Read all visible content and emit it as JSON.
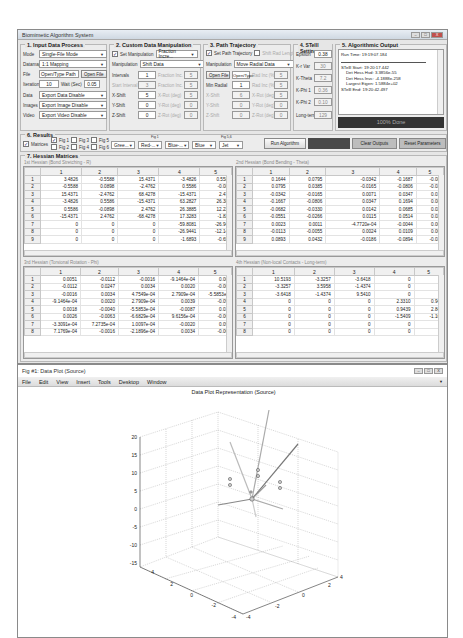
{
  "main_window": {
    "title": "Biomimetic Algorithm System",
    "controls": {
      "minimize": "–",
      "maximize": "□",
      "close": "X"
    }
  },
  "input_panel": {
    "title": "1. Input Data Process",
    "mode_label": "Mode",
    "mode_value": "Single-File Mode",
    "dataset_label": "Datamap",
    "dataset_value": "1:1 Mapping",
    "file_label": "File",
    "file_value": "Open/Type Path",
    "open_file_button": "Open File",
    "iteration_label": "Iteration",
    "iteration_value": "10",
    "wait_label": "Wait (Sec)",
    "wait_value": "0.05",
    "data_label": "Data",
    "data_value": "Export Data Disable",
    "images_label": "Images",
    "images_value": "Export Image Disable",
    "video_label": "Video",
    "video_value": "Export Video Disable"
  },
  "custom_panel": {
    "title": "2. Custom Data Manipulation",
    "set_manipulation_label": "Set Manipulation",
    "set_manipulation_checked": true,
    "fraction_value": "Fraction Incre...",
    "manipulation_label": "Manipulation",
    "manipulation_value": "Shift Data",
    "rows": [
      {
        "label": "Intervals",
        "value": "1",
        "dis_label": "Fraction Inc.",
        "dis_value": "5"
      },
      {
        "label": "Start Interval",
        "value": "3",
        "dis_label": "Fraction Inc.",
        "dis_value": "5"
      },
      {
        "label": "X-Shift",
        "value": "5",
        "dis_label": "X-Rot (deg)",
        "dis_value": "5"
      },
      {
        "label": "Y-Shift",
        "value": "0",
        "dis_label": "Y-Rot (deg)",
        "dis_value": "0"
      },
      {
        "label": "Z-Shift",
        "value": "0",
        "dis_label": "Z-Rot (deg)",
        "dis_value": "0"
      }
    ]
  },
  "path_panel": {
    "title": "3. Path Trajectory",
    "set_path_label": "Set Path Trajectory",
    "set_path_checked": true,
    "shift_rad_label": "Shift Rad Length",
    "shift_rad_checked": false,
    "manipulation_label": "Manipulation",
    "manipulation_value": "Move Radial Data",
    "open_file_button": "Open File",
    "open_type_value": "Open/Type",
    "rows": [
      {
        "label": "Min Radial",
        "value": "1",
        "dis_label": "Rad Inc (%)",
        "dis_value": "5"
      },
      {
        "label": "X-Shift",
        "value": "6",
        "dis_label": "X-Rot (deg)",
        "dis_value": "5"
      },
      {
        "label": "Y-Shift",
        "value": "0",
        "dis_label": "Y-Rot (deg)",
        "dis_value": "0"
      },
      {
        "label": "Z-Shift",
        "value": "0",
        "dis_label": "Z-Rot (deg)",
        "dis_value": "0"
      }
    ],
    "top_dis_label": "Rad Inc (%)",
    "top_dis_value": "5"
  },
  "stell_panel": {
    "title": "4. STelll Setting",
    "rows": [
      {
        "label": "Epsilon",
        "value": "0.38"
      },
      {
        "label": "K-r Var",
        "value": "30"
      },
      {
        "label": "K-Theta",
        "value": "7.2"
      },
      {
        "label": "K-Phi 1",
        "value": "0.36"
      },
      {
        "label": "K-Phi 2",
        "value": "0.10"
      },
      {
        "label": "Long-term",
        "value": "129"
      }
    ]
  },
  "output_panel": {
    "title": "5. Algorithmic Output",
    "run_time": "Run Time: 19:19:07.184",
    "lines": [
      "STelll Start: 19:20:17.442",
      "Det Hess Hvd: 3.3856e-55",
      "Det Hess Invc: -4.1888e-258",
      "Largest Eigen: 1.5884e+02",
      "STelll End: 19:20:42.497"
    ],
    "progress": "100% Done"
  },
  "results_panel": {
    "title": "6. Results",
    "matrices_label": "Matrices",
    "matrices_checked": true,
    "figs": [
      {
        "label": "Fig 1",
        "checked": true
      },
      {
        "label": "Fig 2",
        "checked": false
      },
      {
        "label": "Fig 3",
        "checked": false
      },
      {
        "label": "Fig 4",
        "checked": false
      },
      {
        "label": "Fig 5",
        "checked": false
      },
      {
        "label": "Fig 6",
        "checked": false
      }
    ],
    "fig1_caption": "Fig 1",
    "fig56_caption": "Fig 5,6",
    "color_selects": [
      "Gree...",
      "Red-...",
      "Blue-...",
      "Blue",
      "Jet"
    ],
    "run_button": "Run Algorithm",
    "clear_button": "Clear Outputs",
    "reset_button": "Reset Parameters"
  },
  "hessian_panel": {
    "title": "7. Hessian Matrices",
    "columns": [
      "1",
      "2",
      "3",
      "4",
      "5"
    ],
    "tables": [
      {
        "caption": "1st Hessian (Bond Stretching - R)",
        "rows": [
          [
            "1",
            "3.4826",
            "-0.5588",
            "15.4371",
            "-3.4826",
            "0.558"
          ],
          [
            "2",
            "-0.5588",
            "0.0898",
            "-2.4762",
            "0.5586",
            "-0.08"
          ],
          [
            "3",
            "15.4371",
            "-2.4762",
            "68.4278",
            "-15.4371",
            "2.47"
          ],
          [
            "4",
            "-3.4826",
            "0.5586",
            "-15.4371",
            "63.2827",
            "26.38"
          ],
          [
            "5",
            "0.5586",
            "-0.0898",
            "2.4762",
            "26.3885",
            "12.22"
          ],
          [
            "6",
            "-15.4371",
            "2.4762",
            "-68.4278",
            "17.3283",
            "-1.82"
          ],
          [
            "7",
            "0",
            "0",
            "0",
            "-59.8081",
            "-26.94"
          ],
          [
            "8",
            "0",
            "0",
            "0",
            "-26.9441",
            "-12.14"
          ],
          [
            "9",
            "0",
            "0",
            "0",
            "-1.6893",
            "-0.65"
          ]
        ]
      },
      {
        "caption": "2nd Hessian (Bond Bending - Theta)",
        "rows": [
          [
            "1",
            "0.1644",
            "0.0795",
            "-0.0342",
            "-0.1687",
            "-0.08"
          ],
          [
            "2",
            "0.0795",
            "0.0385",
            "-0.0165",
            "-0.0806",
            "-0.03"
          ],
          [
            "3",
            "-0.0342",
            "-0.0165",
            "0.0071",
            "0.0347",
            "0.01"
          ],
          [
            "4",
            "-0.1667",
            "-0.0806",
            "0.0347",
            "0.1694",
            "0.08"
          ],
          [
            "5",
            "-0.0682",
            "-0.0330",
            "0.0142",
            "0.0685",
            "0.02"
          ],
          [
            "6",
            "-0.0551",
            "-0.0266",
            "0.0115",
            "0.0514",
            "0.02"
          ],
          [
            "7",
            "0.0023",
            "0.0011",
            "-4.7720e-04",
            "-0.0044",
            "0.00"
          ],
          [
            "8",
            "-0.0113",
            "-0.0055",
            "0.0024",
            "0.0109",
            "0.00"
          ],
          [
            "9",
            "0.0893",
            "0.0432",
            "-0.0186",
            "-0.0894",
            "-0.03"
          ]
        ]
      },
      {
        "caption": "3rd Hessian (Torsional Rotation - Phi)",
        "rows": [
          [
            "1",
            "0.0051",
            "-0.0112",
            "-0.0016",
            "-9.1464e-04",
            "0.00"
          ],
          [
            "2",
            "-0.0112",
            "0.0247",
            "0.0034",
            "0.0020",
            "-0.00"
          ],
          [
            "3",
            "-0.0016",
            "0.0034",
            "4.7549e-04",
            "2.7909e-04",
            "-5.5853e-"
          ],
          [
            "4",
            "-9.1464e-04",
            "0.0020",
            "2.7909e-04",
            "0.0039",
            "-0.09"
          ],
          [
            "5",
            "0.0018",
            "-0.0040",
            "-5.5853e-04",
            "-0.0087",
            "0.01"
          ],
          [
            "6",
            "0.0026",
            "-0.0063",
            "-6.6829e-04",
            "9.6156e-04",
            "-0.06"
          ],
          [
            "7",
            "-3.3091e-04",
            "7.2735e-04",
            "1.0097e-04",
            "-0.0020",
            "0.09"
          ],
          [
            "8",
            "7.1769e-04",
            "-0.0016",
            "-2.1896e-04",
            "0.0034",
            "-0.06"
          ]
        ]
      },
      {
        "caption": "4th Hessian (Non-local Contacts - Long-term)",
        "rows": [
          [
            "1",
            "10.5193",
            "-3.3257",
            "-3.6418",
            "0",
            ""
          ],
          [
            "2",
            "-3.3257",
            "3.5958",
            "-1.4374",
            "0",
            ""
          ],
          [
            "3",
            "-3.6418",
            "-1.4374",
            "9.5410",
            "0",
            ""
          ],
          [
            "4",
            "0",
            "0",
            "0",
            "2.3310",
            "0.94"
          ],
          [
            "5",
            "0",
            "0",
            "0",
            "0.9439",
            "2.84"
          ],
          [
            "6",
            "0",
            "0",
            "0",
            "-1.5409",
            "-1.16"
          ],
          [
            "7",
            "0",
            "0",
            "0",
            "0",
            ""
          ],
          [
            "8",
            "0",
            "0",
            "0",
            "0",
            ""
          ]
        ]
      }
    ]
  },
  "figure_window": {
    "title": "Fig #1: Data Plot (Source)",
    "menu": [
      "File",
      "Edit",
      "View",
      "Insert",
      "Tools",
      "Desktop",
      "Window"
    ],
    "controls": {
      "minimize": "–",
      "maximize": "□",
      "close": "X"
    }
  },
  "chart_data": {
    "type": "scatter",
    "title": "Data Plot Representation (Source)",
    "projection": "3d",
    "z_ticks": [
      "20",
      "15",
      "10",
      "5",
      "0",
      "-5",
      "-10",
      "-15"
    ],
    "x_ticks": [
      "4",
      "2",
      "0",
      "-2",
      "-4"
    ],
    "y_ticks": [
      "-4",
      "-2",
      "0",
      "2",
      "4"
    ],
    "zlim": [
      -15,
      20
    ],
    "xlim": [
      -4,
      4
    ],
    "ylim": [
      -4,
      4
    ],
    "grid": true,
    "annotations": "Bond lines radiating from central node with small circular markers"
  }
}
